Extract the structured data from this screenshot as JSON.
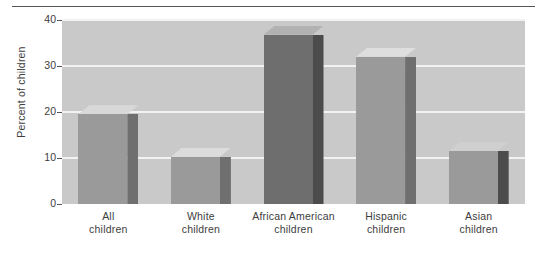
{
  "chart_data": {
    "type": "bar",
    "title": "",
    "subtitle": "",
    "xlabel": "",
    "ylabel": "Percent of children",
    "categories": [
      "All children",
      "White children",
      "African American children",
      "Hispanic children",
      "Asian children"
    ],
    "category_lines": [
      [
        "All",
        "children"
      ],
      [
        "White",
        "children"
      ],
      [
        "African American",
        "children"
      ],
      [
        "Hispanic",
        "children"
      ],
      [
        "Asian",
        "children"
      ]
    ],
    "values": [
      19.5,
      10.3,
      36.8,
      32.0,
      11.5
    ],
    "ylim": [
      0,
      40
    ],
    "yticks": [
      0,
      10,
      20,
      30,
      40
    ],
    "ytick_labels": [
      "0",
      "10",
      "20",
      "30",
      "40"
    ],
    "grid": true,
    "grid_axis": "y",
    "legend": false,
    "legend_position": "none",
    "bar_colors": [
      "#9a9a9a",
      "#9a9a9a",
      "#6e6e6e",
      "#9a9a9a",
      "#9a9a9a"
    ],
    "bar_side_colors": [
      "#6f6f6f",
      "#6f6f6f",
      "#4c4c4c",
      "#6f6f6f",
      "#4c4c4c"
    ],
    "bar_top_colors": [
      "#d8d8d8",
      "#dcdcdc",
      "#b2b2b2",
      "#dedede",
      "#cfcfcf"
    ],
    "plot_background": "#c9c9c9",
    "gridline_color": "#f2f2f2",
    "axis_color": "#555555",
    "text_color": "#3d3d3d",
    "page_background": "#ffffff"
  },
  "figure": {
    "top_rule_visible": true
  }
}
